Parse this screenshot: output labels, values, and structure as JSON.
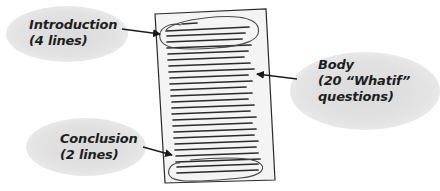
{
  "diagram": {
    "title": "",
    "labels": {
      "introduction": {
        "line1": "Introduction",
        "line2": "(4 lines)"
      },
      "body": {
        "line1": "Body",
        "line2": "(20 “Whatif”",
        "line3": "questions)"
      },
      "conclusion": {
        "line1": "Conclusion",
        "line2": "(2 lines)"
      }
    },
    "page": {
      "total_lines": 26,
      "introduction_lines": 4,
      "body_lines": 20,
      "conclusion_lines": 2
    },
    "colors": {
      "bubble": "#e0e0e0",
      "page_fill": "#f4f4f4",
      "line": "#2a2a2a",
      "text": "#1e1e1e"
    }
  }
}
